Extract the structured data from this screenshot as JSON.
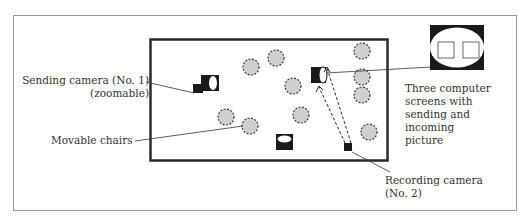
{
  "labels": {
    "sending_camera_line1": "Sending camera (No. 1)",
    "sending_camera_line2": "(zoomable)",
    "movable_chairs": "Movable chairs",
    "screens_line1": "Three computer",
    "screens_line2": "screens with",
    "screens_line3": "sending and",
    "screens_line4": "incoming",
    "screens_line5": "picture",
    "recording_camera_line1": "Recording camera",
    "recording_camera_line2": "(No. 2)"
  },
  "colors": {
    "frame": "#9a9a9a",
    "room_wall": "#2b2b2b",
    "chair_fill": "#cfcfcf",
    "chair_stroke": "#3a3a3a",
    "object": "#1a1a1a"
  },
  "diagram": {
    "outer_frame": {
      "x": 13,
      "y": 15,
      "w": 503,
      "h": 195
    },
    "room": {
      "x": 150,
      "y": 39,
      "w": 237,
      "h": 121
    },
    "chairs": [
      {
        "cx": 251,
        "cy": 67
      },
      {
        "cx": 276,
        "cy": 58
      },
      {
        "cx": 293,
        "cy": 86
      },
      {
        "cx": 301,
        "cy": 115
      },
      {
        "cx": 226,
        "cy": 117
      },
      {
        "cx": 250,
        "cy": 126
      },
      {
        "cx": 362,
        "cy": 51
      },
      {
        "cx": 362,
        "cy": 77
      },
      {
        "cx": 362,
        "cy": 95
      },
      {
        "cx": 369,
        "cy": 132
      }
    ],
    "chair_radius": 8,
    "icons": [
      "sending-camera-icon",
      "screen-stand-icon",
      "table-icon",
      "recording-camera-icon",
      "computer-screens-icon"
    ]
  }
}
